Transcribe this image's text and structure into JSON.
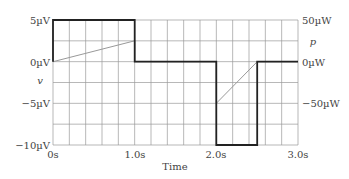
{
  "chart_data": {
    "type": "line",
    "title": "",
    "xlabel": "Time",
    "ylabel_left": "v",
    "ylabel_right": "p",
    "xlim": [
      0,
      3
    ],
    "ylim_left": [
      -10,
      5
    ],
    "ylim_right": [
      -100,
      50
    ],
    "x_ticks": [
      "0s",
      "1.0s",
      "2.0s",
      "3.0s"
    ],
    "y_ticks_left": [
      "5µV",
      "0µV",
      "−5µV",
      "−10µV"
    ],
    "y_ticks_right": [
      "50µW",
      "0µW",
      "−50µW"
    ],
    "grid": true,
    "series": [
      {
        "name": "v",
        "unit": "µV",
        "axis": "left",
        "color": "#222222",
        "style": "step",
        "points": [
          [
            0,
            0
          ],
          [
            0,
            5
          ],
          [
            1,
            5
          ],
          [
            1,
            0
          ],
          [
            2,
            0
          ],
          [
            2,
            -10
          ],
          [
            2.5,
            -10
          ],
          [
            2.5,
            0
          ],
          [
            3,
            0
          ]
        ]
      },
      {
        "name": "p",
        "unit": "µW",
        "axis": "right",
        "color": "#999999",
        "style": "line",
        "points": [
          [
            0,
            0
          ],
          [
            1,
            25
          ],
          [
            1,
            0
          ],
          [
            2,
            0
          ],
          [
            2,
            -50
          ],
          [
            2.5,
            0
          ],
          [
            3,
            0
          ]
        ]
      }
    ]
  },
  "labels": {
    "xlabel": "Time",
    "left_axis_var": "v",
    "right_axis_var": "p",
    "x_ticks": [
      "0s",
      "1.0s",
      "2.0s",
      "3.0s"
    ],
    "y_left": [
      "5µV",
      "0µV",
      "−5µV",
      "−10µV"
    ],
    "y_right": [
      "50µW",
      "0µW",
      "−50µW"
    ]
  }
}
